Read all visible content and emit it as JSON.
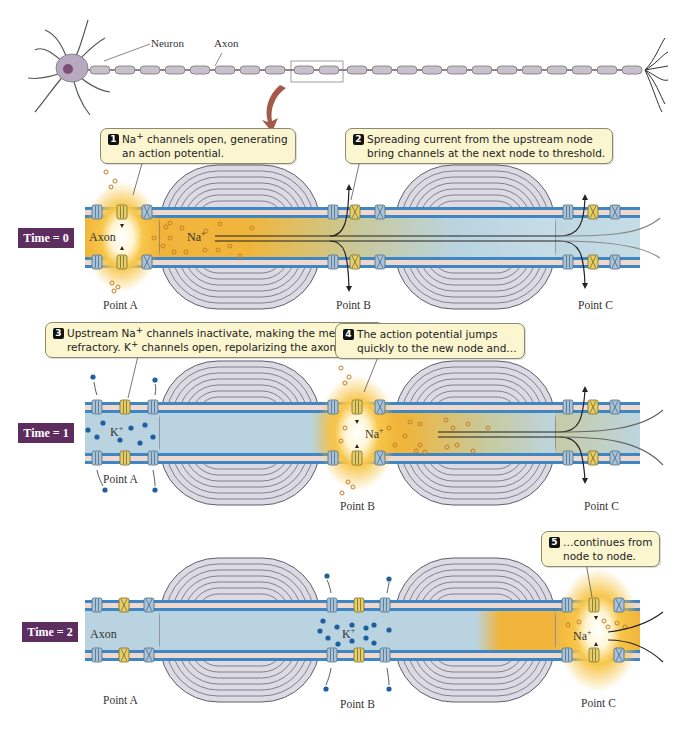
{
  "overview": {
    "neuron_label": "Neuron",
    "axon_label": "Axon"
  },
  "colors": {
    "axoplasm": "#b9d4e0",
    "membrane_blue": "#3f86c4",
    "membrane_core": "#efd9cf",
    "myelin_fill": "#d9d7e0",
    "myelin_line": "#6a6a78",
    "na_ion": "#d9902f",
    "k_ion": "#1f5f9e",
    "depolarized": "#f0b53a",
    "time_label_bg": "#5c2d5e",
    "callout_bg": "#fbf6cf",
    "pointer_arrow": "#a35a48",
    "k_channel": "#a9c3d8",
    "na_channel": "#e5cf6a"
  },
  "panels": [
    {
      "time_label": "Time = 0",
      "axon_label": "Axon",
      "ion_label": "Na",
      "ion_charge": "+",
      "callouts": [
        {
          "number": "1",
          "line1_pre": "Na",
          "line1_sup": "+",
          "line1_post": " channels open, generating",
          "line2": "an action potential."
        },
        {
          "number": "2",
          "line1": "Spreading current from the upstream node",
          "line2": "bring channels at the next node to threshold."
        }
      ],
      "points": [
        "Point A",
        "Point B",
        "Point C"
      ]
    },
    {
      "time_label": "Time = 1",
      "k_label": "K",
      "k_charge": "+",
      "ion_label": "Na",
      "ion_charge": "+",
      "callouts": [
        {
          "number": "3",
          "line1_pre": "Upstream Na",
          "line1_sup": "+",
          "line1_post": " channels inactivate, making the membrane",
          "line2_pre": "refractory. K",
          "line2_sup": "+",
          "line2_post": " channels open, repolarizing the axon."
        },
        {
          "number": "4",
          "line1": "The action potential jumps",
          "line2": "quickly to the new node and…"
        }
      ],
      "points": [
        "Point A",
        "Point B",
        "Point C"
      ]
    },
    {
      "time_label": "Time = 2",
      "axon_label": "Axon",
      "k_label": "K",
      "k_charge": "+",
      "ion_label": "Na",
      "ion_charge": "+",
      "callouts": [
        {
          "number": "5",
          "line1": "…continues from",
          "line2": "node to node."
        }
      ],
      "points": [
        "Point A",
        "Point B",
        "Point C"
      ]
    }
  ]
}
